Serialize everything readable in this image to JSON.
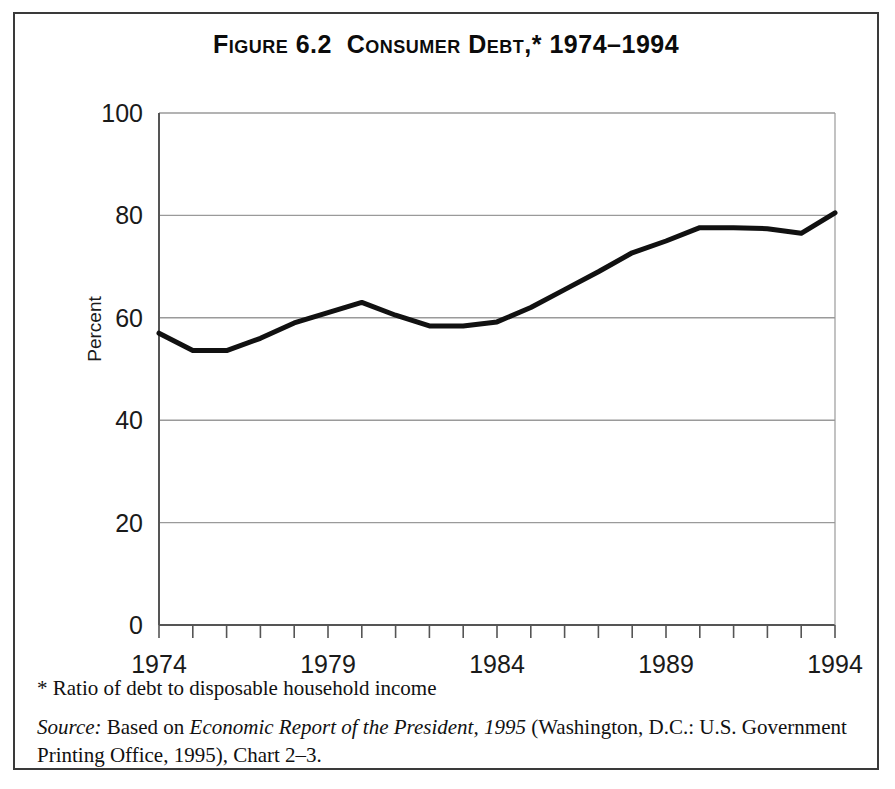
{
  "figure": {
    "title": "Figure 6.2  Consumer Debt,* 1974–1994",
    "footnote": "* Ratio of debt to disposable household income",
    "source_prefix": "Source:",
    "source_text_1": " Based on ",
    "source_italic": "Economic Report of the President, 1995",
    "source_text_2": " (Washington, D.C.: U.S. Government Printing Office, 1995),  Chart 2–3."
  },
  "colors": {
    "line": "#111111",
    "grid": "#9a9a9a",
    "axis": "#555555",
    "frame": "#3a3a3a",
    "text": "#111111"
  },
  "chart_data": {
    "type": "line",
    "title": "Figure 6.2  Consumer Debt,* 1974–1994",
    "xlabel": "",
    "ylabel": "Percent",
    "xlim": [
      1974,
      1994
    ],
    "ylim": [
      0,
      100
    ],
    "ytick_values": [
      0,
      20,
      40,
      60,
      80,
      100
    ],
    "ytick_labels": [
      "0",
      "20",
      "40",
      "60",
      "80",
      "100"
    ],
    "xtick_values": [
      1974,
      1975,
      1976,
      1977,
      1978,
      1979,
      1980,
      1981,
      1982,
      1983,
      1984,
      1985,
      1986,
      1987,
      1988,
      1989,
      1990,
      1991,
      1992,
      1993,
      1994
    ],
    "xtick_labels_shown": [
      "1974",
      "1979",
      "1984",
      "1989",
      "1994"
    ],
    "xtick_labels_shown_values": [
      1974,
      1979,
      1984,
      1989,
      1994
    ],
    "grid": "horizontal",
    "legend": "none",
    "series": [
      {
        "name": "Consumer debt as percent of disposable household income",
        "x": [
          1974,
          1975,
          1976,
          1977,
          1978,
          1979,
          1980,
          1981,
          1982,
          1983,
          1984,
          1985,
          1986,
          1987,
          1988,
          1989,
          1990,
          1991,
          1992,
          1993,
          1994
        ],
        "values": [
          57.0,
          53.6,
          53.6,
          56.0,
          59.0,
          61.0,
          63.0,
          60.5,
          58.4,
          58.4,
          59.2,
          62.0,
          65.5,
          69.0,
          72.7,
          75.0,
          77.6,
          77.6,
          77.4,
          76.5,
          80.5
        ]
      }
    ]
  }
}
